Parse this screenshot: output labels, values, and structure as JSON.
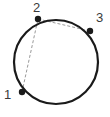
{
  "figure": {
    "type": "circle-with-inscribed-points",
    "canvas": {
      "width": 110,
      "height": 117,
      "background": "#ffffff"
    },
    "circle": {
      "name": "circle-outline",
      "cx": 56,
      "cy": 62,
      "r": 42,
      "stroke_color": "#1a1a1a",
      "stroke_width": 2.2,
      "fill": "none"
    },
    "points": [
      {
        "id": "1",
        "label": "1",
        "x": 22,
        "y": 92,
        "marker_color": "#1a1a1a",
        "marker_size": 4
      },
      {
        "id": "2",
        "label": "2",
        "x": 38,
        "y": 19,
        "marker_color": "#1a1a1a",
        "marker_size": 4
      },
      {
        "id": "3",
        "label": "3",
        "x": 90,
        "y": 31,
        "marker_color": "#1a1a1a",
        "marker_size": 4
      }
    ],
    "chords": [
      {
        "name": "chord-1-2",
        "from": "1",
        "to": "2",
        "x1": 22,
        "y1": 92,
        "x2": 38,
        "y2": 19,
        "stroke_color": "#9a9a9a",
        "stroke_width": 1,
        "dash": "3 2"
      },
      {
        "name": "chord-2-3",
        "from": "2",
        "to": "3",
        "x1": 38,
        "y1": 19,
        "x2": 90,
        "y2": 31,
        "stroke_color": "#9a9a9a",
        "stroke_width": 1,
        "dash": "3 2"
      }
    ],
    "labels": {
      "point_1": "1",
      "point_2": "2",
      "point_3": "3"
    }
  }
}
